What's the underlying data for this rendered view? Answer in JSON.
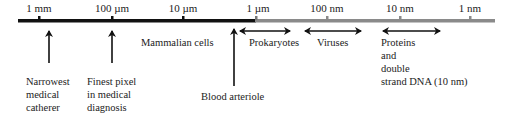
{
  "diagram": {
    "type": "logarithmic size scale",
    "scale_ticks": [
      {
        "label": "1 mm",
        "x": 39
      },
      {
        "label": "100 µm",
        "x": 112
      },
      {
        "label": "10 µm",
        "x": 183
      },
      {
        "label": "1 µm",
        "x": 255
      },
      {
        "label": "100 nm",
        "x": 327
      },
      {
        "label": "10 nm",
        "x": 400
      },
      {
        "label": "1 nm",
        "x": 470
      }
    ],
    "bar_colors": {
      "micro_segment": "#111111",
      "nano_segment": "#8a8a8a"
    },
    "pointers": [
      {
        "label_lines": [
          "Narrowest",
          "medical",
          "catherer"
        ],
        "x": 49
      },
      {
        "label_lines": [
          "Finest pixel",
          "in medical",
          "diagnosis"
        ],
        "x": 112
      },
      {
        "label_lines": [
          "Blood arteriole"
        ],
        "x": 234
      }
    ],
    "ranges": [
      {
        "label": "Mammalian cells"
      },
      {
        "label": "Prokaryotes"
      },
      {
        "label": "Viruses"
      },
      {
        "label_lines": [
          "Proteins",
          "and",
          "double",
          "strand DNA (10 nm)"
        ]
      }
    ]
  }
}
